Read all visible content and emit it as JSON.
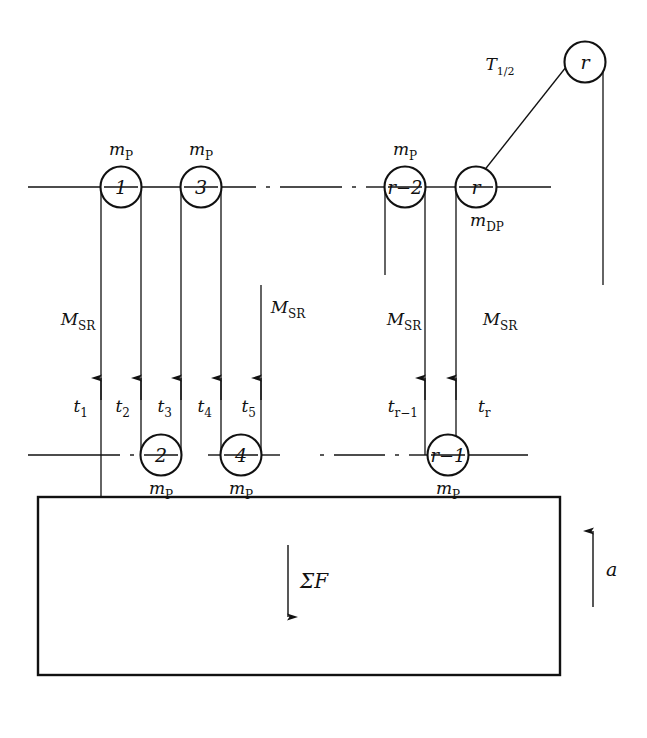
{
  "figure": {
    "stroke_color": "#111111",
    "background_color": "#ffffff"
  },
  "top_pulley": {
    "label": "r",
    "tension_label_main": "T",
    "tension_label_sub": "1/2"
  },
  "upper_row": {
    "pulleys": [
      {
        "label": "1",
        "mass_label_main": "m",
        "mass_label_sub": "P"
      },
      {
        "label": "3",
        "mass_label_main": "m",
        "mass_label_sub": "P"
      },
      {
        "label": "r−2",
        "mass_label_main": "m",
        "mass_label_sub": "P"
      },
      {
        "label": "r",
        "mass_label_main": "m",
        "mass_label_sub": "DP"
      }
    ]
  },
  "lower_row": {
    "pulleys": [
      {
        "label": "2",
        "mass_label_main": "m",
        "mass_label_sub": "P"
      },
      {
        "label": "4",
        "mass_label_main": "m",
        "mass_label_sub": "P"
      },
      {
        "label": "r−1",
        "mass_label_main": "m",
        "mass_label_sub": "P"
      }
    ]
  },
  "rope_segments": {
    "strand_label_main": "M",
    "strand_label_sub": "SR",
    "strand_labels": [
      {
        "main": "M",
        "sub": "SR"
      },
      {
        "main": "M",
        "sub": "SR"
      },
      {
        "main": "M",
        "sub": "SR"
      },
      {
        "main": "M",
        "sub": "SR"
      }
    ],
    "tensions": [
      {
        "main": "t",
        "sub": "1"
      },
      {
        "main": "t",
        "sub": "2"
      },
      {
        "main": "t",
        "sub": "3"
      },
      {
        "main": "t",
        "sub": "4"
      },
      {
        "main": "t",
        "sub": "5"
      },
      {
        "main": "t",
        "sub": "r−1"
      },
      {
        "main": "t",
        "sub": "r"
      }
    ]
  },
  "block": {
    "force_label": "ΣF",
    "acceleration_label": "a"
  }
}
